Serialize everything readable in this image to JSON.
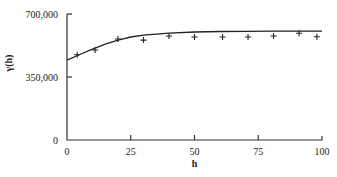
{
  "chart_data": {
    "type": "scatter",
    "title": "",
    "xlabel": "h",
    "ylabel": "γ(h)",
    "xlim": [
      0,
      100
    ],
    "ylim": [
      0,
      700000
    ],
    "x_ticks": [
      0,
      25,
      50,
      75,
      100
    ],
    "x_tick_labels": [
      "0",
      "25",
      "50",
      "75",
      "100"
    ],
    "y_ticks": [
      0,
      350000,
      700000
    ],
    "y_tick_labels": [
      "0",
      "350,000",
      "700,000"
    ],
    "grid": false,
    "legend": null,
    "series": [
      {
        "name": "empirical semivariogram",
        "style": "markers-plus",
        "x": [
          4,
          11,
          20,
          30,
          40,
          50,
          61,
          71,
          81,
          91,
          98
        ],
        "y": [
          474000,
          500000,
          561000,
          555000,
          578000,
          572000,
          572000,
          572000,
          578000,
          593000,
          574000
        ]
      },
      {
        "name": "fitted model",
        "style": "line",
        "x": [
          0,
          5,
          10,
          15,
          20,
          25,
          30,
          40,
          50,
          60,
          70,
          80,
          90,
          100
        ],
        "y": [
          444000,
          475000,
          505000,
          532000,
          555000,
          572000,
          583000,
          594000,
          600000,
          603000,
          604000,
          605000,
          605000,
          605000
        ]
      }
    ]
  }
}
